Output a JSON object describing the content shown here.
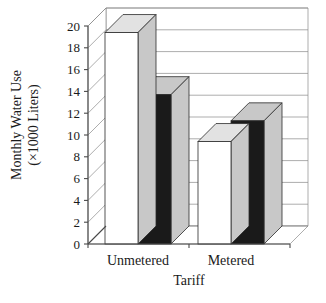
{
  "chart_data": {
    "type": "bar",
    "title": "",
    "subtitle": "",
    "xlabel": "Tariff",
    "ylabel": "Monthly Water Use (×1000 Liters)",
    "ylabel_line1": "Monthly Water Use",
    "ylabel_line2": "(×1000 Liters)",
    "categories": [
      "Unmetered",
      "Metered"
    ],
    "series": [
      {
        "name": "series-1",
        "color": "#ffffff",
        "values": [
          19.4,
          9.4
        ]
      },
      {
        "name": "series-2",
        "color": "#1a1a1a",
        "values": [
          13.7,
          11.3
        ]
      }
    ],
    "ylim": [
      0,
      20
    ],
    "ytick_step": 2,
    "ytick_labels": [
      "0",
      "2",
      "4",
      "6",
      "8",
      "10",
      "12",
      "14",
      "16",
      "18",
      "20"
    ],
    "ytick_values": [
      0,
      2,
      4,
      6,
      8,
      10,
      12,
      14,
      16,
      18,
      20
    ],
    "grid": true,
    "grid_axis": "y",
    "legend": "none",
    "legend_position": "none",
    "projection": "3d",
    "annotations": []
  },
  "colors": {
    "bar_light": "#ffffff",
    "bar_dark": "#1a1a1a",
    "face_shade": "#c8c8c8",
    "top_shade": "#e2e2e2",
    "grid": "#8a8a8a",
    "axis": "#4a4a4a",
    "text": "#1a1a1a",
    "background": "#ffffff"
  }
}
